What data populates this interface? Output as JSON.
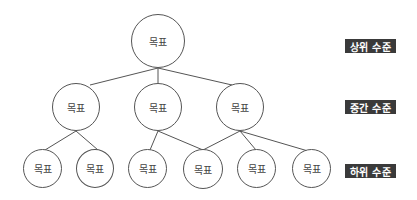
{
  "diagram": {
    "type": "goal-hierarchy-tree",
    "node_label": "목표",
    "levels": [
      {
        "label": "상위 수준"
      },
      {
        "label": "중간 수준"
      },
      {
        "label": "하위 수준"
      }
    ],
    "nodes": {
      "top": {
        "label": "목표"
      },
      "mid": [
        {
          "label": "목표"
        },
        {
          "label": "목표"
        },
        {
          "label": "목표"
        }
      ],
      "low": [
        {
          "label": "목표"
        },
        {
          "label": "목표"
        },
        {
          "label": "목표"
        },
        {
          "label": "목표"
        },
        {
          "label": "목표"
        },
        {
          "label": "목표"
        }
      ]
    },
    "edges": [
      [
        "top",
        "mid.0"
      ],
      [
        "top",
        "mid.1"
      ],
      [
        "top",
        "mid.2"
      ],
      [
        "mid.0",
        "low.0"
      ],
      [
        "mid.0",
        "low.1"
      ],
      [
        "mid.1",
        "low.2"
      ],
      [
        "mid.1",
        "low.3"
      ],
      [
        "mid.2",
        "low.3"
      ],
      [
        "mid.2",
        "low.4"
      ],
      [
        "mid.2",
        "low.5"
      ]
    ],
    "colors": {
      "line": "#555555",
      "label_bg": "#3a3a3a",
      "label_text": "#ffffff"
    }
  }
}
